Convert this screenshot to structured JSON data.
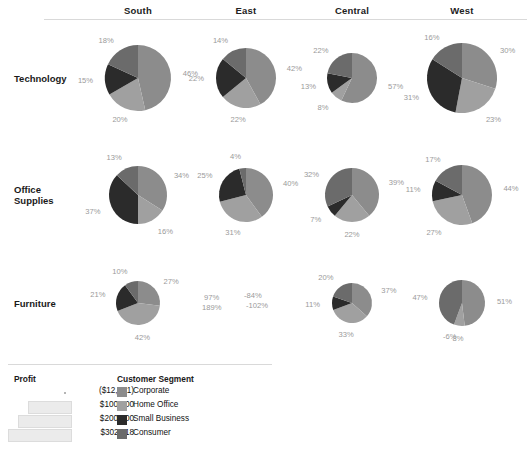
{
  "chart_data": {
    "type": "pie",
    "title": "",
    "layout": "small-multiples grid of pie charts, rows = Category, columns = Region",
    "grid": false,
    "legend_position": "bottom-left",
    "column_headers": [
      "South",
      "East",
      "Central",
      "West"
    ],
    "row_headers": [
      "Technology",
      "Office\nSupplies",
      "Furniture"
    ],
    "segment_names": [
      "Corporate",
      "Home Office",
      "Small Business",
      "Consumer"
    ],
    "segment_colors": [
      "#8c8c8c",
      "#a0a0a0",
      "#2b2b2b",
      "#6b6b6b"
    ],
    "size_encoding": "pie area encodes Profit",
    "cells": [
      {
        "row": "Technology",
        "column": "South",
        "radius_px": 33,
        "has_pie": true,
        "slices": [
          {
            "segment": "Corporate",
            "label": "46%",
            "value": 46
          },
          {
            "segment": "Home Office",
            "label": "20%",
            "value": 20
          },
          {
            "segment": "Small Business",
            "label": "15%",
            "value": 15
          },
          {
            "segment": "Consumer",
            "label": "18%",
            "value": 18
          }
        ]
      },
      {
        "row": "Technology",
        "column": "East",
        "radius_px": 30,
        "has_pie": true,
        "slices": [
          {
            "segment": "Corporate",
            "label": "42%",
            "value": 42
          },
          {
            "segment": "Home Office",
            "label": "22%",
            "value": 22
          },
          {
            "segment": "Small Business",
            "label": "22%",
            "value": 22
          },
          {
            "segment": "Consumer",
            "label": "14%",
            "value": 14
          }
        ]
      },
      {
        "row": "Technology",
        "column": "Central",
        "radius_px": 25,
        "has_pie": true,
        "slices": [
          {
            "segment": "Corporate",
            "label": "57%",
            "value": 57
          },
          {
            "segment": "Home Office",
            "label": "8%",
            "value": 8
          },
          {
            "segment": "Small Business",
            "label": "13%",
            "value": 13
          },
          {
            "segment": "Consumer",
            "label": "22%",
            "value": 22
          }
        ]
      },
      {
        "row": "Technology",
        "column": "West",
        "radius_px": 35,
        "has_pie": true,
        "slices": [
          {
            "segment": "Corporate",
            "label": "30%",
            "value": 30
          },
          {
            "segment": "Home Office",
            "label": "23%",
            "value": 23
          },
          {
            "segment": "Small Business",
            "label": "31%",
            "value": 31
          },
          {
            "segment": "Consumer",
            "label": "16%",
            "value": 16
          }
        ]
      },
      {
        "row": "Office Supplies",
        "column": "South",
        "radius_px": 29,
        "has_pie": true,
        "slices": [
          {
            "segment": "Corporate",
            "label": "34%",
            "value": 34
          },
          {
            "segment": "Home Office",
            "label": "16%",
            "value": 16
          },
          {
            "segment": "Small Business",
            "label": "37%",
            "value": 37
          },
          {
            "segment": "Consumer",
            "label": "13%",
            "value": 13
          }
        ]
      },
      {
        "row": "Office Supplies",
        "column": "East",
        "radius_px": 27,
        "has_pie": true,
        "slices": [
          {
            "segment": "Corporate",
            "label": "40%",
            "value": 40
          },
          {
            "segment": "Home Office",
            "label": "31%",
            "value": 31
          },
          {
            "segment": "Small Business",
            "label": "25%",
            "value": 25
          },
          {
            "segment": "Consumer",
            "label": "4%",
            "value": 4
          }
        ]
      },
      {
        "row": "Office Supplies",
        "column": "Central",
        "radius_px": 27,
        "has_pie": true,
        "slices": [
          {
            "segment": "Corporate",
            "label": "39%",
            "value": 39
          },
          {
            "segment": "Home Office",
            "label": "22%",
            "value": 22
          },
          {
            "segment": "Small Business",
            "label": "7%",
            "value": 7
          },
          {
            "segment": "Consumer",
            "label": "32%",
            "value": 32
          }
        ]
      },
      {
        "row": "Office Supplies",
        "column": "West",
        "radius_px": 30,
        "has_pie": true,
        "slices": [
          {
            "segment": "Corporate",
            "label": "44%",
            "value": 44
          },
          {
            "segment": "Home Office",
            "label": "27%",
            "value": 27
          },
          {
            "segment": "Small Business",
            "label": "11%",
            "value": 11
          },
          {
            "segment": "Consumer",
            "label": "17%",
            "value": 17
          }
        ]
      },
      {
        "row": "Furniture",
        "column": "South",
        "radius_px": 22,
        "has_pie": true,
        "slices": [
          {
            "segment": "Corporate",
            "label": "27%",
            "value": 27
          },
          {
            "segment": "Home Office",
            "label": "42%",
            "value": 42
          },
          {
            "segment": "Small Business",
            "label": "21%",
            "value": 21
          },
          {
            "segment": "Consumer",
            "label": "10%",
            "value": 10
          }
        ]
      },
      {
        "row": "Furniture",
        "column": "East",
        "radius_px": 0,
        "has_pie": false,
        "note": "negative profit - no pie drawn, only labels",
        "floating_labels": [
          {
            "label": "97%",
            "value": 97
          },
          {
            "label": "-84%",
            "value": -84
          },
          {
            "label": "189%",
            "value": 189
          },
          {
            "label": "-102%",
            "value": -102
          }
        ]
      },
      {
        "row": "Furniture",
        "column": "Central",
        "radius_px": 20,
        "has_pie": true,
        "slices": [
          {
            "segment": "Corporate",
            "label": "37%",
            "value": 37
          },
          {
            "segment": "Home Office",
            "label": "33%",
            "value": 33
          },
          {
            "segment": "Small Business",
            "label": "11%",
            "value": 11
          },
          {
            "segment": "Consumer",
            "label": "20%",
            "value": 20
          }
        ]
      },
      {
        "row": "Furniture",
        "column": "West",
        "radius_px": 23,
        "has_pie": true,
        "slices": [
          {
            "segment": "Corporate",
            "label": "51%",
            "value": 51
          },
          {
            "segment": "Home Office",
            "label": "8%",
            "value": 8
          },
          {
            "segment": "Small Business",
            "label": "-6%",
            "value": -6
          },
          {
            "segment": "Consumer",
            "label": "47%",
            "value": 47
          }
        ]
      }
    ]
  },
  "legend": {
    "size": {
      "title": "Profit",
      "items": [
        {
          "label": "($12,721)",
          "width_px": 3
        },
        {
          "label": "$100,000",
          "width_px": 42
        },
        {
          "label": "$200,000",
          "width_px": 52
        },
        {
          "label": "$302,118",
          "width_px": 62
        }
      ]
    },
    "color": {
      "title": "Customer Segment",
      "items": [
        {
          "label": "Corporate",
          "color": "#8c8c8c"
        },
        {
          "label": "Home Office",
          "color": "#a0a0a0"
        },
        {
          "label": "Small Business",
          "color": "#2b2b2b"
        },
        {
          "label": "Consumer",
          "color": "#6b6b6b"
        }
      ]
    }
  }
}
